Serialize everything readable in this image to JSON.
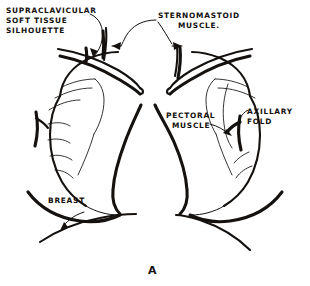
{
  "figure": {
    "name": "chest-radiograph-soft-tissue-line-drawing",
    "panel_label": "A",
    "background_color": "#ffffff",
    "ink_color": "#14110f"
  },
  "labels": {
    "supraclavicular": {
      "line1": "SUPRACLAVICULAR",
      "line2": "SOFT  TISSUE",
      "line3": "SILHOUETTE"
    },
    "sternomastoid": {
      "line1": "STERNOMASTOID",
      "line2": "MUSCLE."
    },
    "pectoral": {
      "line1": "PECTORAL",
      "line2": "MUSCLE"
    },
    "axillary": {
      "line1": "AXILLARY",
      "line2": "FOLD"
    },
    "breast": {
      "line1": "BREAST"
    }
  },
  "structures": [
    {
      "name": "left-lung-silhouette"
    },
    {
      "name": "right-lung-silhouette"
    },
    {
      "name": "left-clavicle"
    },
    {
      "name": "right-clavicle"
    },
    {
      "name": "left-sternomastoid-shadow"
    },
    {
      "name": "right-sternomastoid-shadow"
    },
    {
      "name": "left-axillary-fold"
    },
    {
      "name": "right-axillary-fold"
    },
    {
      "name": "left-rib-markings"
    },
    {
      "name": "right-rib-markings"
    },
    {
      "name": "mediastinal-border-left"
    },
    {
      "name": "mediastinal-border-right"
    },
    {
      "name": "left-diaphragm"
    },
    {
      "name": "right-diaphragm"
    },
    {
      "name": "left-breast-shadow"
    },
    {
      "name": "right-breast-shadow"
    }
  ]
}
